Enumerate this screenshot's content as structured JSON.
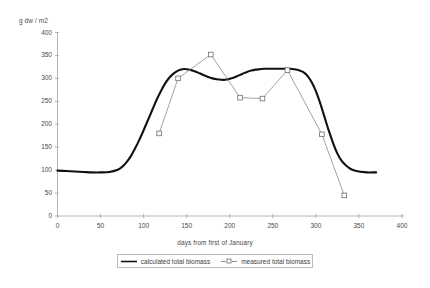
{
  "chart_data": {
    "type": "line",
    "title": "",
    "xlabel": "days from first of January",
    "ylabel": "g dw / m2",
    "xlim": [
      0,
      400
    ],
    "ylim": [
      0,
      400
    ],
    "xticks": [
      0,
      50,
      100,
      150,
      200,
      250,
      300,
      350,
      400
    ],
    "yticks": [
      0,
      50,
      100,
      150,
      200,
      250,
      300,
      350,
      400
    ],
    "xtick_labels": [
      "0",
      "50",
      "100",
      "150",
      "200",
      "250",
      "300",
      "350",
      "400"
    ],
    "ytick_labels": [
      "0",
      "50",
      "100",
      "150",
      "200",
      "250",
      "300",
      "350",
      "400"
    ],
    "grid": false,
    "legend_position": "bottom",
    "series": [
      {
        "name": "calculated total biomass",
        "marker": "none",
        "style": "solid-thick-black",
        "color": "#000000",
        "x": [
          0,
          10,
          20,
          30,
          40,
          50,
          60,
          70,
          75,
          80,
          85,
          90,
          95,
          100,
          105,
          110,
          115,
          120,
          125,
          130,
          135,
          140,
          145,
          150,
          155,
          160,
          165,
          170,
          175,
          180,
          185,
          190,
          195,
          200,
          205,
          210,
          215,
          220,
          225,
          230,
          235,
          240,
          245,
          250,
          255,
          260,
          265,
          270,
          275,
          280,
          285,
          290,
          295,
          300,
          305,
          310,
          315,
          320,
          325,
          330,
          335,
          340,
          345,
          350,
          355,
          360,
          365,
          370
        ],
        "y": [
          99,
          98,
          97,
          96,
          95,
          95,
          96,
          101,
          107,
          117,
          130,
          147,
          166,
          187,
          209,
          231,
          253,
          272,
          289,
          302,
          311,
          317,
          320,
          320,
          318,
          315,
          311,
          307,
          303,
          300,
          298,
          297,
          297,
          299,
          302,
          306,
          310,
          314,
          317,
          319,
          320,
          321,
          321,
          321,
          321,
          321,
          321,
          321,
          320,
          318,
          314,
          306,
          292,
          272,
          246,
          216,
          186,
          159,
          136,
          120,
          110,
          103,
          99,
          97,
          96,
          95,
          95,
          95
        ]
      },
      {
        "name": "measured total biomass",
        "marker": "open-square",
        "style": "thin-line-with-markers",
        "color": "#777777",
        "x": [
          118,
          140,
          178,
          212,
          238,
          267,
          307,
          333
        ],
        "y": [
          180,
          300,
          352,
          258,
          256,
          318,
          178,
          45
        ]
      }
    ]
  },
  "legend": {
    "entries": [
      {
        "label": "calculated total biomass",
        "marker": "line"
      },
      {
        "label": "measured total biomass",
        "marker": "line-square"
      }
    ]
  },
  "axis": {
    "y_title": "g dw / m2",
    "x_title": "days from first of January"
  }
}
